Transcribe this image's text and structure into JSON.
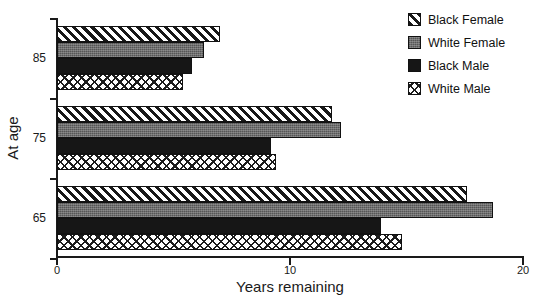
{
  "chart_data": {
    "type": "bar",
    "orientation": "horizontal",
    "title": "",
    "xlabel": "Years remaining",
    "ylabel": "At age",
    "categories": [
      "65",
      "75",
      "85"
    ],
    "category_order_top_to_bottom": [
      "85",
      "75",
      "65"
    ],
    "xlim": [
      0,
      20
    ],
    "xticks": [
      0,
      10,
      20
    ],
    "xticklabels": [
      "0",
      "10",
      "20"
    ],
    "grid": false,
    "legend_position": "top-right",
    "series": [
      {
        "name": "Black Female",
        "pattern": "diagonal-stripes",
        "color": "#ffffff",
        "values": [
          17.6,
          11.8,
          7.0
        ]
      },
      {
        "name": "White Female",
        "pattern": "gray-fill",
        "color": "#6e6e6e",
        "values": [
          18.7,
          12.2,
          6.3
        ]
      },
      {
        "name": "Black Male",
        "pattern": "solid-black",
        "color": "#161616",
        "values": [
          13.9,
          9.2,
          5.8
        ]
      },
      {
        "name": "White Male",
        "pattern": "crosshatch",
        "color": "#ffffff",
        "values": [
          14.8,
          9.4,
          5.4
        ]
      }
    ]
  },
  "legend": {
    "items": [
      {
        "label": "Black Female",
        "pattern": "diagonal-stripes"
      },
      {
        "label": "White Female",
        "pattern": "gray-fill"
      },
      {
        "label": "Black Male",
        "pattern": "solid-black"
      },
      {
        "label": "White Male",
        "pattern": "crosshatch"
      }
    ]
  }
}
